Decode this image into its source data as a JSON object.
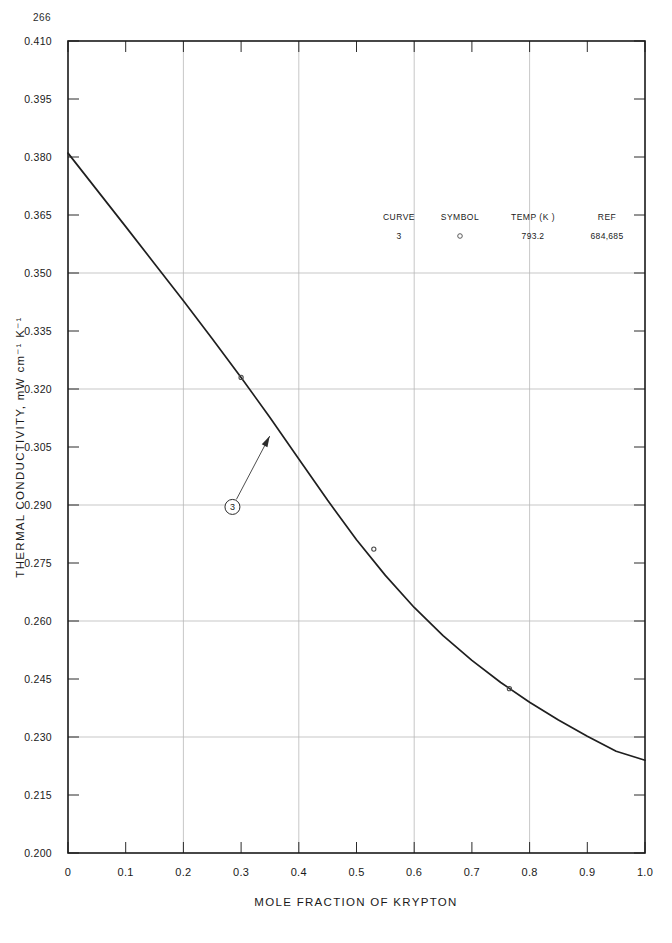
{
  "page": {
    "number": "266"
  },
  "chart_data": {
    "type": "line",
    "title": "",
    "xlabel": "MOLE FRACTION OF KRYPTON",
    "ylabel": "THERMAL CONDUCTIVITY, mW cm⁻¹ K⁻¹",
    "xlim": [
      0.0,
      1.0
    ],
    "ylim": [
      0.2,
      0.41
    ],
    "xticks": [
      0.0,
      0.1,
      0.2,
      0.3,
      0.4,
      0.5,
      0.6,
      0.7,
      0.8,
      0.9,
      1.0
    ],
    "xtick_labels": [
      "0",
      "0.1",
      "0.2",
      "0.3",
      "0.4",
      "0.5",
      "0.6",
      "0.7",
      "0.8",
      "0.9",
      "1.0"
    ],
    "yticks": [
      0.2,
      0.215,
      0.23,
      0.245,
      0.26,
      0.275,
      0.29,
      0.305,
      0.32,
      0.335,
      0.35,
      0.365,
      0.38,
      0.395,
      0.41
    ],
    "ytick_labels": [
      "0.200",
      "0.215",
      "0.230",
      "0.245",
      "0.260",
      "0.275",
      "0.290",
      "0.305",
      "0.320",
      "0.335",
      "0.350",
      "0.365",
      "0.380",
      "0.395",
      "0.410"
    ],
    "grid": {
      "x_gridlines": [
        0.2,
        0.4,
        0.6,
        0.8
      ],
      "y_gridlines": [
        0.23,
        0.26,
        0.29,
        0.32,
        0.35
      ],
      "style": "light-gray"
    },
    "legend": {
      "position": "upper-center-inside",
      "headers": [
        "CURVE",
        "SYMBOL",
        "TEMP (K )",
        "REF"
      ],
      "rows": [
        {
          "curve": "3",
          "symbol": "o",
          "temp": "793.2",
          "ref": "684,685"
        }
      ]
    },
    "annotations": [
      {
        "label": "3",
        "shape": "circled-number",
        "x": 0.285,
        "y": 0.2895,
        "points_to_x": 0.352,
        "points_to_y": 0.3085
      }
    ],
    "series": [
      {
        "name": "Curve 3",
        "temp_k": 793.2,
        "symbol": "open-circle",
        "x": [
          0.0,
          0.05,
          0.1,
          0.15,
          0.2,
          0.25,
          0.3,
          0.35,
          0.4,
          0.45,
          0.5,
          0.55,
          0.6,
          0.65,
          0.7,
          0.75,
          0.8,
          0.85,
          0.9,
          0.95,
          1.0
        ],
        "y": [
          0.381,
          0.3715,
          0.362,
          0.3524,
          0.3428,
          0.333,
          0.323,
          0.3126,
          0.3019,
          0.2912,
          0.281,
          0.2718,
          0.2635,
          0.2562,
          0.2498,
          0.2441,
          0.239,
          0.2344,
          0.2302,
          0.2263,
          0.224
        ],
        "data_points": [
          {
            "x": 0.3,
            "y": 0.323
          },
          {
            "x": 0.53,
            "y": 0.2786
          },
          {
            "x": 0.765,
            "y": 0.2425
          }
        ]
      }
    ]
  }
}
